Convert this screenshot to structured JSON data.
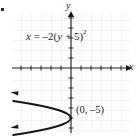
{
  "figure": {
    "corner_mark": "bullet-mark"
  },
  "axes": {
    "x_axis_label": "x",
    "y_axis_label": "y",
    "x_axis_arrow": "arrow-right",
    "y_axis_arrow": "arrow-up"
  },
  "labels": {
    "equation": {
      "lhs": "x",
      "equals": "=",
      "coefficient": "–2",
      "open_paren": "(",
      "variable": "y",
      "plus": "+",
      "constant": "5",
      "close_paren": ")",
      "exponent": "2",
      "full_text": "x = –2(y + 5)²"
    },
    "point": {
      "text": "(0, –5)",
      "x": 0,
      "y": -5
    }
  },
  "chart_data": {
    "type": "line",
    "xlabel": "x",
    "ylabel": "y",
    "grid": true,
    "legend": false,
    "xlim": [
      -6,
      6
    ],
    "ylim": [
      -12,
      6
    ],
    "grid_step": 1,
    "tick_step": 1,
    "orientation": "opens-left",
    "vertex": [
      0,
      -5
    ],
    "series": [
      {
        "name": "x = –2(y + 5)²",
        "equation": "x = -2*(y + 5)^2",
        "color": "#141414",
        "arrow_start": true,
        "arrow_end": true,
        "points": [
          {
            "x": -5.78,
            "y": -3.3
          },
          {
            "x": -4.5,
            "y": -3.5
          },
          {
            "x": -3.38,
            "y": -3.7
          },
          {
            "x": -2.42,
            "y": -3.9
          },
          {
            "x": -1.62,
            "y": -4.1
          },
          {
            "x": -0.98,
            "y": -4.3
          },
          {
            "x": -0.5,
            "y": -4.5
          },
          {
            "x": -0.18,
            "y": -4.7
          },
          {
            "x": -0.02,
            "y": -4.9
          },
          {
            "x": 0.0,
            "y": -5.0
          },
          {
            "x": -0.02,
            "y": -5.1
          },
          {
            "x": -0.18,
            "y": -5.3
          },
          {
            "x": -0.5,
            "y": -5.5
          },
          {
            "x": -0.98,
            "y": -5.7
          },
          {
            "x": -1.62,
            "y": -5.9
          },
          {
            "x": -2.42,
            "y": -6.1
          },
          {
            "x": -3.38,
            "y": -6.3
          },
          {
            "x": -4.5,
            "y": -6.5
          },
          {
            "x": -5.78,
            "y": -6.7
          }
        ]
      }
    ]
  },
  "colors": {
    "curve": "#141414",
    "axis": "#1a1a1a",
    "grid_minor": "#d8d8d8",
    "grid_major": "#bdbdbd",
    "text": "#1a1a1a",
    "background": "#ffffff"
  }
}
